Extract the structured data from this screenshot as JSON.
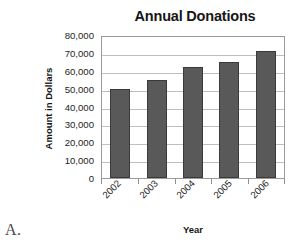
{
  "figure": {
    "letter": "A."
  },
  "chart_data": {
    "type": "bar",
    "title": "Annual Donations",
    "xlabel": "Year",
    "ylabel": "Amount in Dollars",
    "categories": [
      "2002",
      "2003",
      "2004",
      "2005",
      "2006"
    ],
    "values": [
      50000,
      55000,
      62000,
      65000,
      71000
    ],
    "ylim": [
      0,
      80000
    ],
    "ytick_step": 10000,
    "ytick_labels": [
      "80,000",
      "70,000",
      "60,000",
      "50,000",
      "40,000",
      "30,000",
      "20,000",
      "10,000",
      "0"
    ],
    "ytick_values": [
      80000,
      70000,
      60000,
      50000,
      40000,
      30000,
      20000,
      10000,
      0
    ],
    "grid": true,
    "legend": false,
    "series_color": "#595959",
    "bar_edge_color": "#3a3a3a",
    "gridline_color": "#bfbfbf",
    "plot_border_color": "#9a9a9a",
    "background_color": "#ffffff",
    "xtick_rotation": -45
  }
}
